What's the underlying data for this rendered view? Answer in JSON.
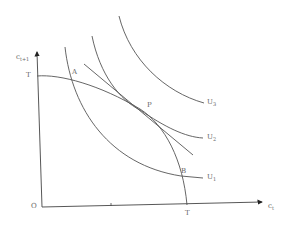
{
  "diagram": {
    "axes": {
      "y_label": "c",
      "y_sub": "t+1",
      "x_label": "c",
      "x_sub": "t",
      "origin": "O"
    },
    "points": {
      "T_y": "T",
      "T_x": "T",
      "A": "A",
      "P": "P",
      "B": "B"
    },
    "curves": {
      "U1": {
        "label": "U",
        "sub": "1"
      },
      "U2": {
        "label": "U",
        "sub": "2"
      },
      "U3": {
        "label": "U",
        "sub": "3"
      }
    },
    "colors": {
      "line": "#555555",
      "text": "#666666"
    }
  }
}
